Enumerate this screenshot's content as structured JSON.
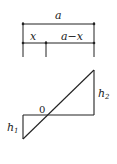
{
  "dimensions": {
    "total": "a",
    "left": "x",
    "right": "a−x"
  },
  "figure": {
    "origin": "0",
    "h1_base": "h",
    "h1_sub": "1",
    "h2_base": "h",
    "h2_sub": "2"
  },
  "colors": {
    "line": "#222222",
    "background": "#ffffff"
  }
}
